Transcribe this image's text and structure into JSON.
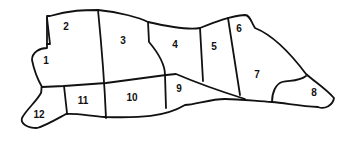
{
  "diagram": {
    "type": "cut-diagram",
    "regions": [
      {
        "id": 1,
        "label": "1",
        "x": 46,
        "y": 61
      },
      {
        "id": 2,
        "label": "2",
        "x": 66,
        "y": 27
      },
      {
        "id": 3,
        "label": "3",
        "x": 123,
        "y": 41
      },
      {
        "id": 4,
        "label": "4",
        "x": 175,
        "y": 45
      },
      {
        "id": 5,
        "label": "5",
        "x": 214,
        "y": 47
      },
      {
        "id": 6,
        "label": "6",
        "x": 239,
        "y": 29
      },
      {
        "id": 7,
        "label": "7",
        "x": 257,
        "y": 75
      },
      {
        "id": 8,
        "label": "8",
        "x": 314,
        "y": 93
      },
      {
        "id": 9,
        "label": "9",
        "x": 179,
        "y": 89
      },
      {
        "id": 10,
        "label": "10",
        "x": 132,
        "y": 98
      },
      {
        "id": 11,
        "label": "11",
        "x": 83,
        "y": 101
      },
      {
        "id": 12,
        "label": "12",
        "x": 39,
        "y": 115
      }
    ],
    "stroke_color": "#111111"
  }
}
